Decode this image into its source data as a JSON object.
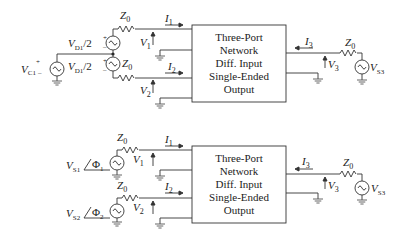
{
  "diagrams": [
    {
      "id": "top",
      "box": {
        "lines": [
          "Three-Port",
          "Network",
          "Diff. Input",
          "Single-Ended",
          "Output"
        ]
      },
      "labels": {
        "z0_top": "Z",
        "z0_top_sub": "0",
        "z0_bot": "Z",
        "z0_bot_sub": "0",
        "z0_out": "Z",
        "z0_out_sub": "0",
        "i1": "I",
        "i1_sub": "1",
        "i2": "I",
        "i2_sub": "2",
        "i3": "I",
        "i3_sub": "3",
        "v1": "V",
        "v1_sub": "1",
        "v2": "V",
        "v2_sub": "2",
        "v3": "V",
        "v3_sub": "3",
        "vd_top": "V",
        "vd_top_sub": "D1",
        "vd_top_tail": "/2",
        "vd_bot": "V",
        "vd_bot_sub": "D1",
        "vd_bot_tail": "/2",
        "vc": "V",
        "vc_sub": "C1",
        "vs3": "V",
        "vs3_sub": "S3",
        "plus": "+",
        "minus": "–"
      }
    },
    {
      "id": "bottom",
      "box": {
        "lines": [
          "Three-Port",
          "Network",
          "Diff. Input",
          "Single-Ended",
          "Output"
        ]
      },
      "labels": {
        "z0_top": "Z",
        "z0_top_sub": "0",
        "z0_bot": "Z",
        "z0_bot_sub": "0",
        "z0_out": "Z",
        "z0_out_sub": "0",
        "i1": "I",
        "i1_sub": "1",
        "i2": "I",
        "i2_sub": "2",
        "i3": "I",
        "i3_sub": "3",
        "v1": "V",
        "v1_sub": "1",
        "v2": "V",
        "v2_sub": "2",
        "v3": "V",
        "v3_sub": "3",
        "vs1": "V",
        "vs1_sub": "S1",
        "phi1": "Φ",
        "phi1_sub": "1",
        "vs2": "V",
        "vs2_sub": "S2",
        "phi2": "Φ",
        "phi2_sub": "2",
        "vs3": "V",
        "vs3_sub": "S3"
      }
    }
  ]
}
